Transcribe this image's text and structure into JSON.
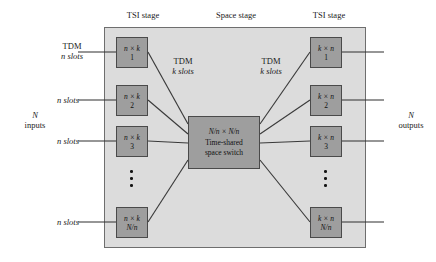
{
  "diagram": {
    "stage_captions": [
      {
        "label": "TSI stage"
      },
      {
        "label": "Space stage"
      },
      {
        "label": "TSI stage"
      }
    ],
    "left_edge": {
      "first_label_line1": "TDM",
      "first_label_line2": "n slots",
      "slot_label": "n slots",
      "io_line1": "N",
      "io_line2": "inputs"
    },
    "right_edge": {
      "io_line1": "N",
      "io_line2": "outputs"
    },
    "link_labels": [
      {
        "line1": "TDM",
        "line2": "k slots"
      },
      {
        "line1": "TDM",
        "line2": "k slots"
      }
    ],
    "input_modules": [
      {
        "size": "n × k",
        "index": "1"
      },
      {
        "size": "n × k",
        "index": "2"
      },
      {
        "size": "n × k",
        "index": "3"
      },
      {
        "size": "n × k",
        "index": "N/n"
      }
    ],
    "output_modules": [
      {
        "size": "k × n",
        "index": "1"
      },
      {
        "size": "k × n",
        "index": "2"
      },
      {
        "size": "k × n",
        "index": "3"
      },
      {
        "size": "k × n",
        "index": "N/n"
      }
    ],
    "center_switch": {
      "size": "N/n × N/n",
      "line1": "Time-shared",
      "line2": "space switch"
    },
    "ellipsis": "⋮",
    "colors": {
      "stage_fill": "#dcdcdc",
      "stage_border": "#6e6e6e",
      "module_fill": "#9e9e9e",
      "module_border": "#4a4a4a",
      "line": "#3a3a3a",
      "text": "#1a1a1a",
      "page_background": "#ffffff"
    }
  }
}
